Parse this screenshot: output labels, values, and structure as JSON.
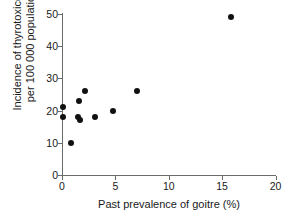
{
  "chart_data": {
    "type": "scatter",
    "title": "",
    "xlabel": "Past prevalence of goitre (%)",
    "ylabel": "Incidence of thyrotoxicosis per 100 000 population",
    "ylabel_lines": [
      "Incidence of thyrotoxicosis",
      "per 100 000 population"
    ],
    "xlim": [
      0,
      20
    ],
    "ylim": [
      0,
      50
    ],
    "xticks": [
      0,
      5,
      10,
      15,
      20
    ],
    "xticklabels": [
      "0",
      "5",
      "10",
      "15",
      "20"
    ],
    "yticks": [
      0,
      10,
      20,
      30,
      40,
      50
    ],
    "yticklabels": [
      "0",
      "10",
      "20",
      "30",
      "40",
      "50"
    ],
    "grid": false,
    "legend": false,
    "marker": "filled-circle",
    "marker_color": "#111111",
    "axis_color": "#6b6b6b",
    "background": "#ffffff",
    "points": [
      {
        "x": 0.1,
        "y": 21
      },
      {
        "x": 0.1,
        "y": 18
      },
      {
        "x": 0.8,
        "y": 10
      },
      {
        "x": 1.6,
        "y": 23
      },
      {
        "x": 1.5,
        "y": 18
      },
      {
        "x": 1.7,
        "y": 17
      },
      {
        "x": 2.2,
        "y": 26
      },
      {
        "x": 3.1,
        "y": 18
      },
      {
        "x": 4.8,
        "y": 20
      },
      {
        "x": 7.0,
        "y": 26
      },
      {
        "x": 15.8,
        "y": 49
      }
    ]
  }
}
